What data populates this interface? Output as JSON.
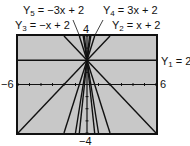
{
  "chart_data": {
    "type": "line",
    "title": "",
    "xlabel": "",
    "ylabel": "",
    "xlim": [
      -6,
      6
    ],
    "ylim": [
      -4,
      4
    ],
    "grid": false,
    "window_labels": {
      "xmin": "−6",
      "xmax": "6",
      "ymin": "−4",
      "ymax": "4"
    },
    "series": [
      {
        "name": "Y1",
        "label_name": "Y",
        "label_sub": "1",
        "label_eq": " = 2",
        "slope": 0,
        "intercept": 2
      },
      {
        "name": "Y2",
        "label_name": "Y",
        "label_sub": "2",
        "label_eq": " = x + 2",
        "slope": 1,
        "intercept": 2
      },
      {
        "name": "Y3",
        "label_name": "Y",
        "label_sub": "3",
        "label_eq": " = −x + 2",
        "slope": -1,
        "intercept": 2
      },
      {
        "name": "Y4",
        "label_name": "Y",
        "label_sub": "4",
        "label_eq": " = 3x + 2",
        "slope": 3,
        "intercept": 2
      },
      {
        "name": "Y5",
        "label_name": "Y",
        "label_sub": "5",
        "label_eq": " = −3x + 2",
        "slope": -3,
        "intercept": 2
      }
    ],
    "additional_lines_visible": "steeper lines through (0,2) also drawn (slopes approx ±6, ±9)",
    "colors": {
      "screen_bg": "#c8c8c8",
      "line": "#111111",
      "frame": "#111111"
    }
  }
}
